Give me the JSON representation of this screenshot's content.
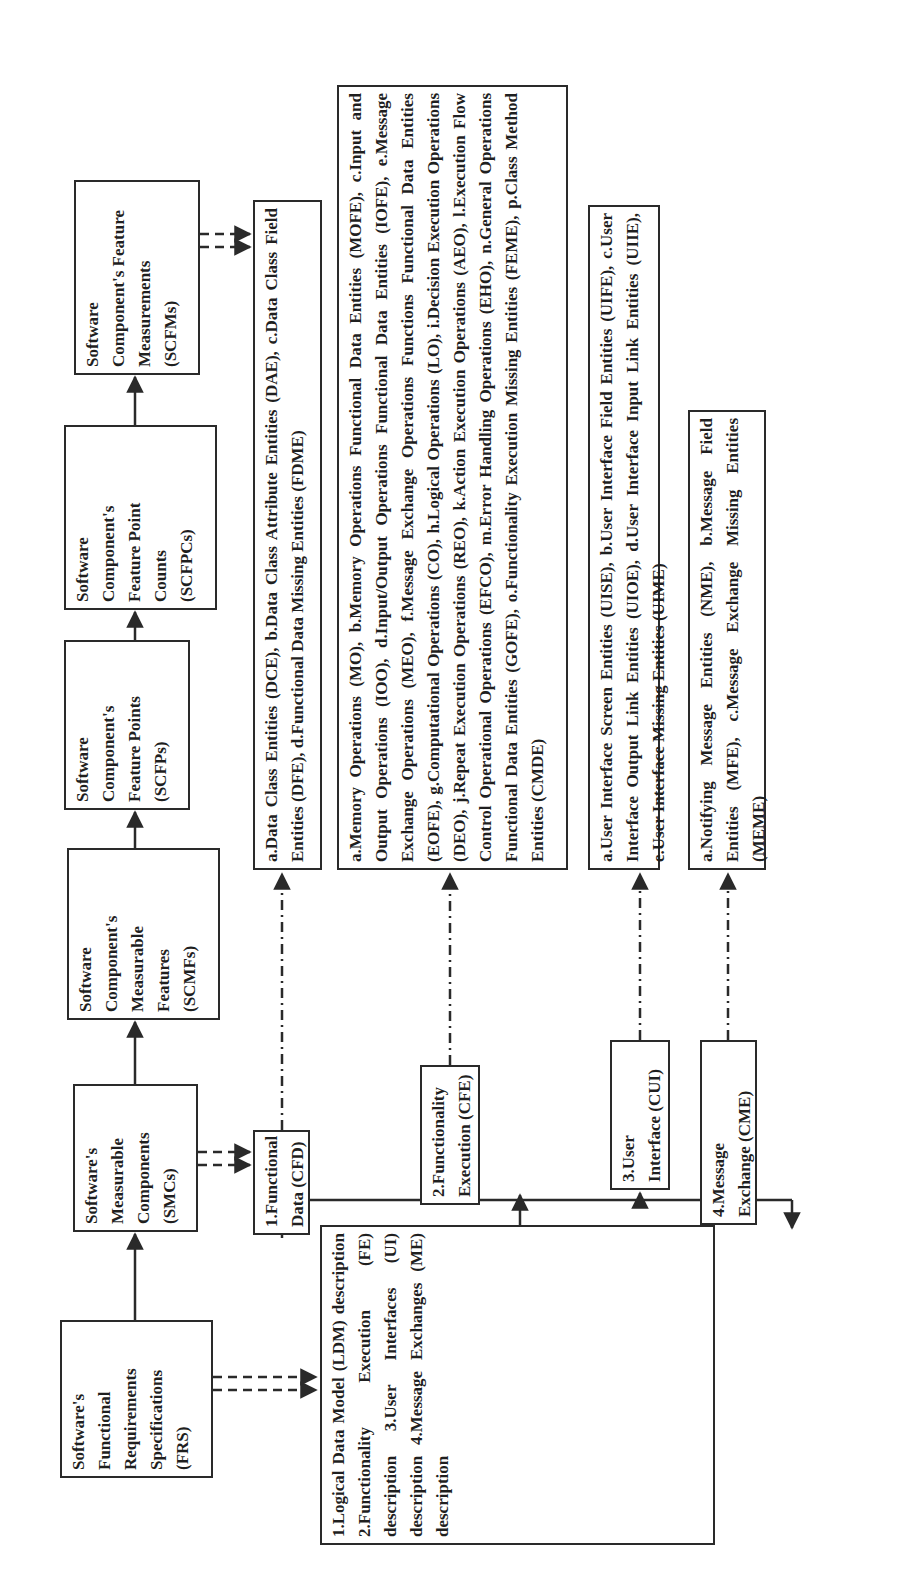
{
  "top_row": {
    "frs": {
      "lines": [
        "Software's",
        "Functional",
        "Requirements",
        "Specifications",
        "(FRS)"
      ]
    },
    "smcs": {
      "lines": [
        "Software's",
        "Measurable",
        "Components",
        "(SMCs)"
      ]
    },
    "scmfs": {
      "lines": [
        "Software",
        "Component's",
        "Measurable",
        "Features",
        "(SCMFs)"
      ]
    },
    "scfps": {
      "lines": [
        "Software",
        "Component's",
        "Feature Points",
        "(SCFPs)"
      ]
    },
    "scfpcs": {
      "lines": [
        "Software",
        "Component's",
        "Feature Point",
        "Counts",
        "(SCFPCs)"
      ]
    },
    "scfms": {
      "lines": [
        "Software",
        "Component's Feature",
        "Measurements",
        "(SCFMs)"
      ]
    }
  },
  "components": {
    "cfd": {
      "lines": [
        "1.Functional",
        "Data (CFD)"
      ]
    },
    "cfe": {
      "lines": [
        "2.Functionality",
        "Execution (CFE)"
      ]
    },
    "cui": {
      "lines": [
        "3.User",
        "Interface (CUI)"
      ]
    },
    "cme": {
      "lines": [
        "4.Message",
        "Exchange (CME)"
      ]
    }
  },
  "frs_contents": {
    "text": "1.Logical Data Model (LDM) description 2.Functionality Execution (FE) description 3.User Interfaces (UI) description 4.Message Exchanges (ME) description"
  },
  "entities": {
    "cfd_entities": "a.Data Class Entities (DCE), b.Data Class Attribute Entities (DAE), c.Data Class Field Entities (DFE), d.Functional Data Missing Entities (FDME)",
    "cfe_entities": "a.Memory Operations (MO), b.Memory Operations Functional Data Entities (MOFE), c.Input and Output Operations (IOO), d.Input/Output Operations Functional Data Entities (IOFE), e.Message Exchange Operations (MEO), f.Message Exchange Operations Functions Functional Data Entities (EOFE), g.Computational Operations (CO), h.Logical Operations (LO), i.Decision Execution Operations (DEO), j.Repeat Execution Operations (REO), k.Action Execution Operations (AEO), l.Execution Flow Control Operational Operations (EFCO), m.Error Handling Operations (EHO), n.General Operations Functional Data Entities (GOFE), o.Functionality Execution Missing Entities (FEME), p.Class Method Entities (CMDE)",
    "cui_entities": "a.User Interface Screen Entities (UISE), b.User Interface Field Entities (UIFE), c.User Interface Output Link Entities (UIOE), d.User Interface Input Link Entities (UIIE), e.User Interface Missing Entities (UIME)",
    "cme_entities": "a.Notifying Message Entities (NME), b.Message Field Entities (MFE), c.Message Exchange Missing Entities (MEME)"
  },
  "colors": {
    "line": "#2a2a2a",
    "background": "#ffffff",
    "text": "#1f1f1f"
  }
}
